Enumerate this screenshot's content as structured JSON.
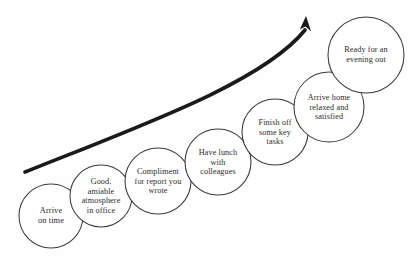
{
  "diagram": {
    "type": "ascending-circle-flow",
    "background_color": "#fefefe",
    "circle_stroke_color": "#3a3a3a",
    "text_color": "#2b2b2b",
    "arrow_color": "#1a1a1a",
    "arrow": {
      "name": "upward-trend-arrow",
      "direction": "up-right",
      "tail": {
        "x": 25,
        "y": 172
      },
      "tip": {
        "x": 306,
        "y": 16
      }
    },
    "nodes": [
      {
        "id": "arrive-on-time",
        "label": "Arrive\non time",
        "cx": 51,
        "cy": 216,
        "r": 32,
        "font_size": 8.4
      },
      {
        "id": "good-atmosphere",
        "label": "Good,\namiable\natmosphere\nin office",
        "cx": 101,
        "cy": 196,
        "r": 31,
        "font_size": 8.2
      },
      {
        "id": "compliment-for-report",
        "label": "Compliment\nfor report you\nwrote",
        "cx": 158,
        "cy": 181,
        "r": 33,
        "font_size": 8.2
      },
      {
        "id": "lunch-with-colleagues",
        "label": "Have lunch\nwith\ncolleagues",
        "cx": 218,
        "cy": 162,
        "r": 33,
        "font_size": 8.2
      },
      {
        "id": "finish-key-tasks",
        "label": "Finish off\nsome key\ntasks",
        "cx": 275,
        "cy": 132,
        "r": 33,
        "font_size": 8.2
      },
      {
        "id": "arrive-home-relaxed",
        "label": "Arrive home\nrelaxed and\nsatisfied",
        "cx": 329,
        "cy": 107,
        "r": 35,
        "font_size": 8.2
      },
      {
        "id": "ready-for-evening",
        "label": "Ready for an\nevening out",
        "cx": 366,
        "cy": 55,
        "r": 38,
        "font_size": 8.2
      }
    ]
  }
}
